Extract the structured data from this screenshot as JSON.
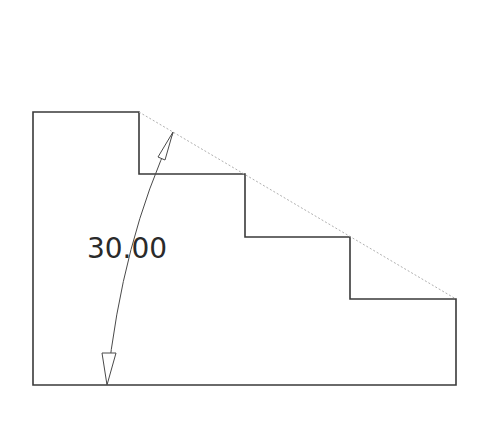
{
  "diagram": {
    "type": "stair-profile-angle-dimension",
    "dimension": {
      "value": "30.00",
      "kind": "angular"
    },
    "colors": {
      "outline": "#3a3a3a",
      "construction": "#b0b0b0",
      "dimension": "#4a4a4a",
      "background": "#ffffff"
    }
  }
}
